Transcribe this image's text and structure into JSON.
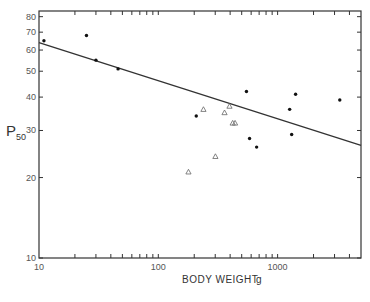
{
  "chart_data": {
    "type": "scatter",
    "title": "",
    "xlabel": "BODY WEIGHT",
    "xunit": "g",
    "ylabel": "P",
    "ylabel_sub": "50",
    "xscale": "log",
    "yscale": "log",
    "xlim": [
      10,
      5000
    ],
    "ylim": [
      10,
      84
    ],
    "grid": false,
    "legend": null,
    "x_tick_labels": [
      "10",
      "100",
      "1000"
    ],
    "y_tick_labels": [
      "10",
      "20",
      "30",
      "40",
      "50",
      "60",
      "70",
      "80"
    ],
    "series": [
      {
        "name": "filled circles",
        "marker": "circle-filled",
        "points": [
          {
            "x": 11,
            "y": 65
          },
          {
            "x": 25,
            "y": 68
          },
          {
            "x": 30,
            "y": 55
          },
          {
            "x": 46,
            "y": 51
          },
          {
            "x": 208,
            "y": 34
          },
          {
            "x": 548,
            "y": 42
          },
          {
            "x": 582,
            "y": 28
          },
          {
            "x": 667,
            "y": 26
          },
          {
            "x": 1262,
            "y": 36
          },
          {
            "x": 1312,
            "y": 29
          },
          {
            "x": 1415,
            "y": 41
          },
          {
            "x": 3320,
            "y": 39
          }
        ]
      },
      {
        "name": "open triangles",
        "marker": "triangle-open",
        "points": [
          {
            "x": 179,
            "y": 21
          },
          {
            "x": 239,
            "y": 36
          },
          {
            "x": 301,
            "y": 24
          },
          {
            "x": 359,
            "y": 35
          },
          {
            "x": 395,
            "y": 37
          },
          {
            "x": 420,
            "y": 32
          },
          {
            "x": 440,
            "y": 32
          }
        ]
      }
    ],
    "regression_line": {
      "x": [
        10,
        5000
      ],
      "y": [
        64,
        26.4
      ]
    }
  }
}
